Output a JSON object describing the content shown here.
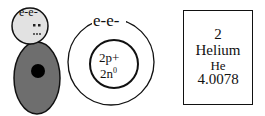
{
  "element_card": {
    "atomic_number": "2",
    "name": "Helium",
    "symbol": "He",
    "atomic_mass": "4.0078"
  },
  "bohr_model": {
    "electron_label": "e-e-",
    "nucleus_line1": "2p+",
    "nucleus_line2_base": "2n",
    "nucleus_line2_sup": "0"
  },
  "figure": {
    "electron_label": "e-e-",
    "head_color": "#e0e0e0",
    "body_color": "#6e6e6e",
    "core_color": "#000000"
  }
}
